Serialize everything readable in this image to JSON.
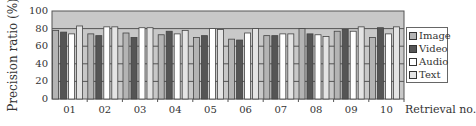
{
  "chart_data": {
    "type": "bar",
    "title": "",
    "xlabel": "Retrieval no.",
    "ylabel": "Precision ratio (%)",
    "ylim": [
      0,
      100
    ],
    "yticks": [
      "0",
      "20",
      "40",
      "60",
      "80",
      "100"
    ],
    "grid": true,
    "legend_position": "right",
    "categories": [
      "01",
      "02",
      "03",
      "04",
      "05",
      "06",
      "07",
      "08",
      "09",
      "10"
    ],
    "series": [
      {
        "name": "Image",
        "color": "#b4b4b4",
        "values": [
          78,
          74,
          75,
          73,
          70,
          68,
          72,
          80,
          77,
          70
        ]
      },
      {
        "name": "Video",
        "color": "#555555",
        "values": [
          76,
          72,
          70,
          77,
          72,
          67,
          72,
          74,
          79,
          81
        ]
      },
      {
        "name": "Audio",
        "color": "#ffffff",
        "values": [
          74,
          82,
          81,
          74,
          80,
          75,
          74,
          73,
          77,
          74
        ]
      },
      {
        "name": "Text",
        "color": "#e4e4e4",
        "values": [
          83,
          82,
          81,
          78,
          79,
          80,
          74,
          71,
          82,
          82
        ]
      }
    ],
    "plot_background": "#c8c8c8"
  }
}
